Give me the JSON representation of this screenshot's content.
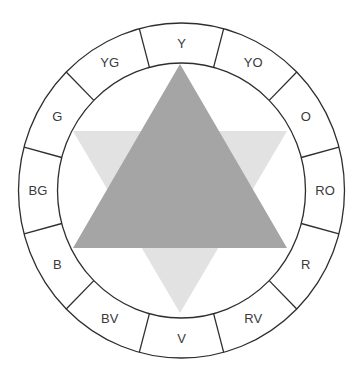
{
  "diagram": {
    "type": "color-wheel",
    "segments": [
      {
        "label": "Y"
      },
      {
        "label": "YO"
      },
      {
        "label": "O"
      },
      {
        "label": "RO"
      },
      {
        "label": "R"
      },
      {
        "label": "RV"
      },
      {
        "label": "V"
      },
      {
        "label": "BV"
      },
      {
        "label": "B"
      },
      {
        "label": "BG"
      },
      {
        "label": "G"
      },
      {
        "label": "YG"
      }
    ],
    "triangles": [
      {
        "name": "secondary-triangle",
        "orientation": "point-down",
        "color": "#e2e2e2"
      },
      {
        "name": "primary-triangle",
        "orientation": "point-up",
        "color": "#a5a5a5"
      }
    ],
    "colors": {
      "stroke": "#2e2e2e",
      "label": "#3a3a3a",
      "background": "#ffffff"
    }
  }
}
